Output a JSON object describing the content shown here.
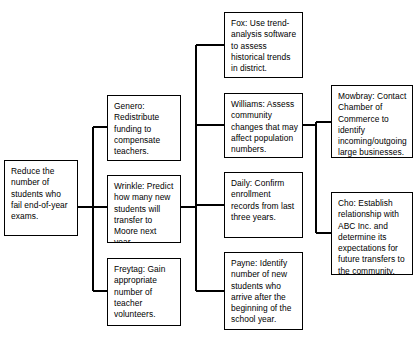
{
  "diagram": {
    "type": "tree-flowchart",
    "line_color": "#000000",
    "box_border_color": "#000000",
    "box_fill_color": "#ffffff",
    "nodes": {
      "root": {
        "id": "root",
        "label": "Reduce the number of students who fail end-of-year exams.",
        "level": 1
      },
      "genero": {
        "id": "genero",
        "label": "Genero: Redistribute funding to compensate teachers.",
        "level": 2
      },
      "wrinkle": {
        "id": "wrinkle",
        "label": "Wrinkle: Predict how many new students will transfer to Moore next year.",
        "level": 2
      },
      "freytag": {
        "id": "freytag",
        "label": "Freytag: Gain appropriate number of teacher volunteers.",
        "level": 2
      },
      "fox": {
        "id": "fox",
        "label": "Fox: Use trend-analysis software to assess historical trends in district.",
        "level": 3
      },
      "williams": {
        "id": "williams",
        "label": "Williams: Assess community changes that may affect population numbers.",
        "level": 3
      },
      "daily": {
        "id": "daily",
        "label": "Daily: Confirm enrollment records from last three years.",
        "level": 3
      },
      "payne": {
        "id": "payne",
        "label": "Payne: Identify number of new students who arrive after the beginning of the school year.",
        "level": 3
      },
      "mowbray": {
        "id": "mowbray",
        "label": "Mowbray: Contact Chamber of Commerce to identify incoming/outgoing large businesses.",
        "level": 4
      },
      "cho": {
        "id": "cho",
        "label": "Cho: Establish relationship with ABC Inc. and determine its expectations for future transfers to the community.",
        "level": 4
      }
    },
    "edges": [
      {
        "from": "root",
        "to": "genero"
      },
      {
        "from": "root",
        "to": "wrinkle"
      },
      {
        "from": "root",
        "to": "freytag"
      },
      {
        "from": "wrinkle",
        "to": "fox"
      },
      {
        "from": "wrinkle",
        "to": "williams"
      },
      {
        "from": "wrinkle",
        "to": "daily"
      },
      {
        "from": "wrinkle",
        "to": "payne"
      },
      {
        "from": "williams",
        "to": "mowbray"
      },
      {
        "from": "williams",
        "to": "cho"
      }
    ]
  }
}
